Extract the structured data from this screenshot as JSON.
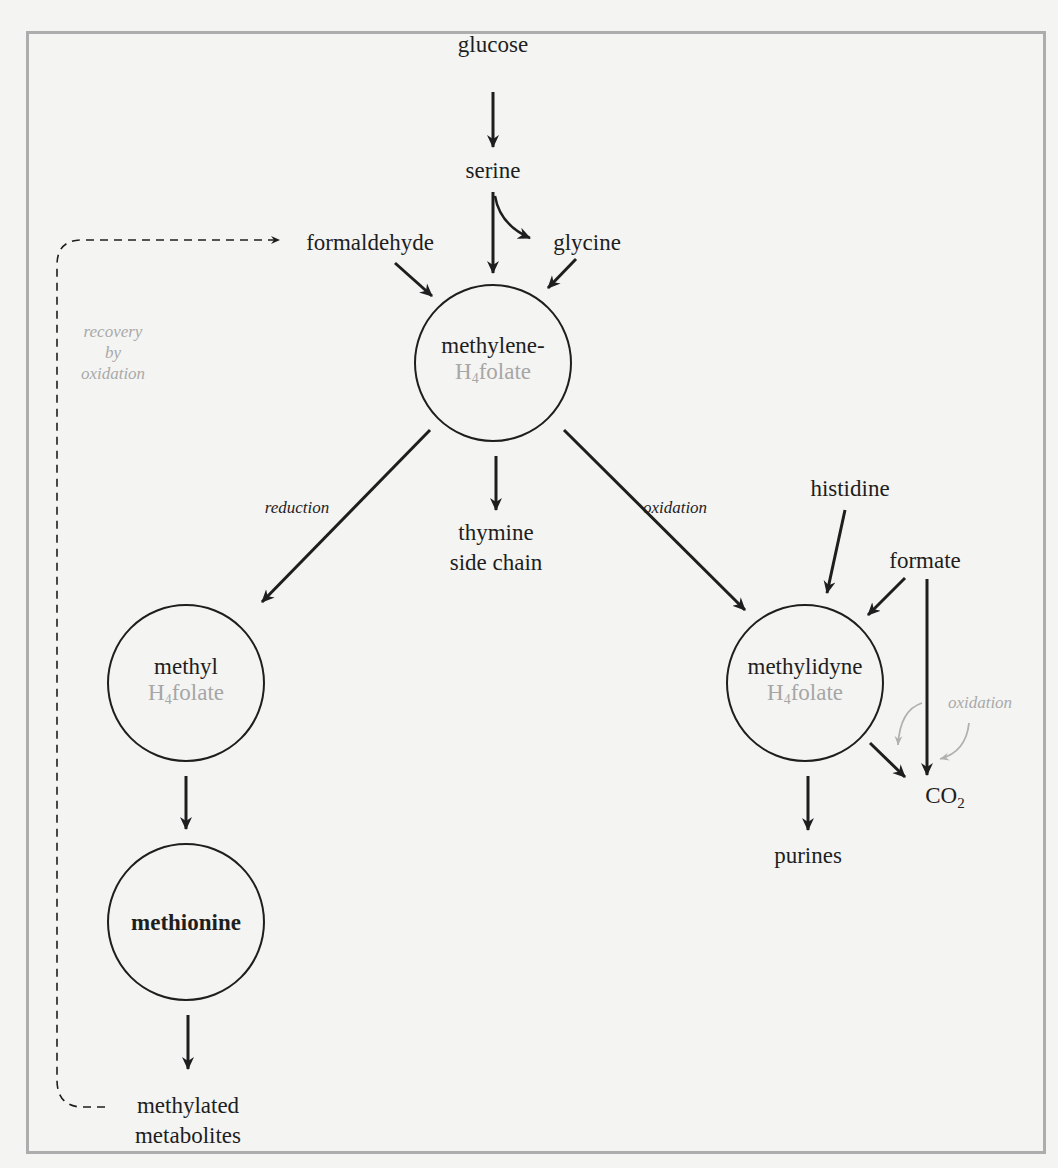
{
  "figure": {
    "title": "",
    "colors": {
      "background": "#f4f4f2",
      "frame": "#adadad",
      "ink": "#1e1e1e",
      "secondary_text": "#a6a6a6",
      "secondary_arrow": "#b0b0b0"
    }
  },
  "nodes": {
    "methylene": {
      "line1": "methylene-",
      "cofactor_h": "H",
      "cofactor_sub": "4",
      "cofactor_rest": "folate"
    },
    "methyl": {
      "line1": "methyl",
      "cofactor_h": "H",
      "cofactor_sub": "4",
      "cofactor_rest": "folate"
    },
    "methionine": {
      "line1": "methionine"
    },
    "methylidyne": {
      "line1": "methylidyne",
      "cofactor_h": "H",
      "cofactor_sub": "4",
      "cofactor_rest": "folate"
    }
  },
  "labels": {
    "glucose": "glucose",
    "serine": "serine",
    "glycine": "glycine",
    "formaldehyde": "formaldehyde",
    "thymine_line1": "thymine",
    "thymine_line2": "side chain",
    "histidine": "histidine",
    "formate": "formate",
    "co2_main": "CO",
    "co2_sub": "2",
    "purines": "purines",
    "methylated_line1": "methylated",
    "methylated_line2": "metabolites"
  },
  "annotations": {
    "reduction": "reduction",
    "oxidation_main": "oxidation",
    "oxidation_co2": "oxidation",
    "recovery_line1": "recovery",
    "recovery_line2": "by",
    "recovery_line3": "oxidation"
  },
  "edges": [
    {
      "from": "glucose",
      "to": "serine",
      "style": "solid"
    },
    {
      "from": "serine",
      "to": "methylene-H4folate",
      "style": "solid"
    },
    {
      "from": "serine",
      "to": "glycine",
      "style": "solid-curved"
    },
    {
      "from": "formaldehyde",
      "to": "methylene-H4folate",
      "style": "solid"
    },
    {
      "from": "glycine",
      "to": "methylene-H4folate",
      "style": "solid"
    },
    {
      "from": "methylene-H4folate",
      "to": "methyl H4folate",
      "label": "reduction",
      "style": "solid"
    },
    {
      "from": "methylene-H4folate",
      "to": "thymine side chain",
      "style": "solid"
    },
    {
      "from": "methylene-H4folate",
      "to": "methylidyne H4folate",
      "label": "oxidation",
      "style": "solid"
    },
    {
      "from": "histidine",
      "to": "methylidyne H4folate",
      "style": "solid"
    },
    {
      "from": "formate",
      "to": "methylidyne H4folate",
      "style": "solid"
    },
    {
      "from": "formate",
      "to": "CO2",
      "style": "solid"
    },
    {
      "from": "methylidyne H4folate",
      "to": "CO2",
      "label": "oxidation",
      "style": "solid"
    },
    {
      "from": "methylidyne H4folate",
      "to": "purines",
      "style": "solid"
    },
    {
      "from": "methyl H4folate",
      "to": "methionine",
      "style": "solid"
    },
    {
      "from": "methionine",
      "to": "methylated metabolites",
      "style": "solid"
    },
    {
      "from": "methylated metabolites",
      "to": "formaldehyde",
      "label": "recovery by oxidation",
      "style": "dashed"
    }
  ]
}
